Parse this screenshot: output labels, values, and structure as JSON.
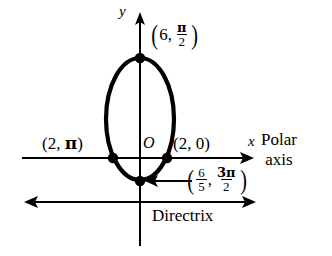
{
  "figure": {
    "background_color": "#ffffff",
    "stroke_color": "#000000",
    "width": 332,
    "height": 256
  },
  "axes": {
    "y_axis_label": "y",
    "x_axis_label": "x",
    "origin_label": "O",
    "x_axis": {
      "x_start": 22,
      "x_end": 252,
      "y": 158,
      "arrow": "right"
    },
    "y_axis": {
      "x": 140,
      "y_start": 14,
      "y_end": 246,
      "arrow": "up"
    }
  },
  "directrix": {
    "label": "Directrix",
    "y": 202,
    "x_start": 25,
    "x_end": 256,
    "arrows": "both"
  },
  "polar_axis": {
    "line1": "Polar",
    "line2": "axis"
  },
  "points": [
    {
      "id": "top-vertex",
      "label_text": "(6, π/2)",
      "r": "6",
      "theta_num": "π",
      "theta_den": "2",
      "x": 140,
      "y": 58
    },
    {
      "id": "left-vertex",
      "label_text": "(2, π)",
      "r": "2",
      "theta": "π",
      "x": 113,
      "y": 158
    },
    {
      "id": "right-vertex",
      "label_text": "(2, 0)",
      "r": "2",
      "theta": "0",
      "x": 167,
      "y": 158
    },
    {
      "id": "bottom-vertex",
      "label_text": "(6/5, 3π/2)",
      "r_num": "6",
      "r_den": "5",
      "theta_num": "3π",
      "theta_den": "2",
      "x": 140,
      "y": 181
    }
  ],
  "curve": {
    "type": "ellipse",
    "cx": 140,
    "cy": 119,
    "rx": 34,
    "ry": 61,
    "stroke_width": 4
  },
  "labels": {
    "left_point": "(2, π)",
    "right_point": "(2, 0)"
  }
}
